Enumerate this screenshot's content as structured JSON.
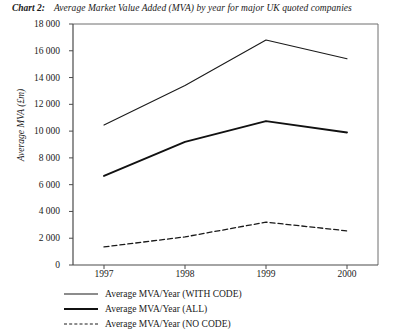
{
  "title": {
    "label": "Chart 2:",
    "text": "Average Market Value Added (MVA) by year for major UK quoted companies"
  },
  "chart_data": {
    "type": "line",
    "title": "Average Market Value Added (MVA) by year for major UK quoted companies",
    "xlabel": "",
    "ylabel": "Average MVA (£m)",
    "categories": [
      "1997",
      "1998",
      "1999",
      "2000"
    ],
    "x": [
      1997,
      1998,
      1999,
      2000
    ],
    "series": [
      {
        "name": "Average MVA/Year (WITH CODE)",
        "style": "solid-thin",
        "color": "#1a1a1a",
        "values": [
          10450,
          13400,
          16800,
          15400
        ]
      },
      {
        "name": "Average MVA/Year (ALL)",
        "style": "solid-thick",
        "color": "#111111",
        "values": [
          6650,
          9200,
          10750,
          9900
        ]
      },
      {
        "name": "Average MVA/Year (NO CODE)",
        "style": "dashed",
        "color": "#1a1a1a",
        "values": [
          1350,
          2100,
          3200,
          2550
        ]
      }
    ],
    "ylim": [
      0,
      18000
    ],
    "yticks": [
      0,
      2000,
      4000,
      6000,
      8000,
      10000,
      12000,
      14000,
      16000,
      18000
    ],
    "ytick_labels": [
      "0",
      "2 000",
      "4 000",
      "6 000",
      "8 000",
      "10 000",
      "12 000",
      "14 000",
      "16 000",
      "18 000"
    ],
    "grid": false,
    "legend_position": "below-left"
  },
  "legend": [
    {
      "label": "Average MVA/Year (WITH CODE)",
      "style": "solid-thin"
    },
    {
      "label": "Average MVA/Year (ALL)",
      "style": "solid-thick"
    },
    {
      "label": "Average MVA/Year (NO CODE)",
      "style": "dashed"
    }
  ]
}
